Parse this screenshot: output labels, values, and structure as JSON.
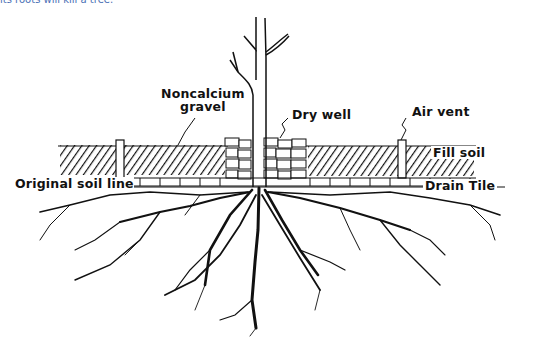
{
  "caption": "its roots will kill a tree.",
  "diagram": {
    "labels": {
      "noncalcium_gravel_line1": "Noncalcium",
      "noncalcium_gravel_line2": "gravel",
      "dry_well": "Dry well",
      "air_vent": "Air vent",
      "fill_soil": "Fill soil",
      "original_soil_line": "Original soil line",
      "drain_tile": "Drain Tile"
    },
    "colors": {
      "ink": "#111111",
      "background": "#ffffff",
      "caption": "#4a6fb5"
    }
  }
}
